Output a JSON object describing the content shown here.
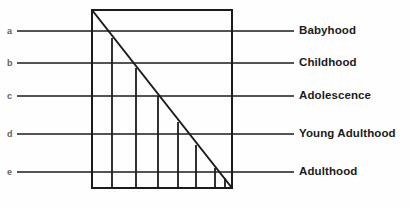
{
  "figure": {
    "background_color": "#fefefe",
    "ink_color": "#1b1b1b",
    "faint_ink_color": "#40403f",
    "width": 409,
    "height": 208
  },
  "rows": [
    {
      "key": "a",
      "label": "Babyhood",
      "leader_y": 31,
      "leader_x_start": 17,
      "leader_x_end": 294,
      "letter_x": 7,
      "label_x": 299
    },
    {
      "key": "b",
      "label": "Childhood",
      "leader_y": 63,
      "leader_x_start": 17,
      "leader_x_end": 294,
      "letter_x": 7,
      "label_x": 299
    },
    {
      "key": "c",
      "label": "Adolescence",
      "leader_y": 96,
      "leader_x_start": 17,
      "leader_x_end": 294,
      "letter_x": 7,
      "label_x": 299
    },
    {
      "key": "d",
      "label": "Young Adulthood",
      "leader_y": 134,
      "leader_x_start": 17,
      "leader_x_end": 294,
      "letter_x": 7,
      "label_x": 299
    },
    {
      "key": "e",
      "label": "Adulthood",
      "leader_y": 172,
      "leader_x_start": 17,
      "leader_x_end": 294,
      "letter_x": 7,
      "label_x": 299
    }
  ],
  "chart_data": {
    "type": "bar",
    "xlabel": "",
    "ylabel": "",
    "grid": false,
    "legend_position": "right",
    "categories": [
      "a",
      "b",
      "c",
      "d",
      "e"
    ],
    "series": [
      {
        "name": "Life stage",
        "labels": [
          "Babyhood",
          "Childhood",
          "Adolescence",
          "Young Adulthood",
          "Adulthood"
        ],
        "values": [
          1,
          2,
          3,
          4,
          5
        ]
      }
    ],
    "annotations": [
      "Diagonal declines from top-left corner to bottom-right corner of the frame",
      "Seven internal vertical tick lines rise from the baseline to meet the diagonal"
    ]
  },
  "frame": {
    "left": 92,
    "right": 232,
    "top": 10,
    "bottom": 188,
    "stroke_width": 2
  },
  "diagonal": {
    "x1": 92,
    "y1": 10,
    "x2": 232,
    "y2": 188,
    "stroke_width": 2
  },
  "verticals": [
    {
      "x": 112,
      "y_top": 38,
      "y_bottom": 188
    },
    {
      "x": 136,
      "y_top": 68,
      "y_bottom": 188
    },
    {
      "x": 158,
      "y_top": 96,
      "y_bottom": 188
    },
    {
      "x": 178,
      "y_top": 122,
      "y_bottom": 188
    },
    {
      "x": 196,
      "y_top": 145,
      "y_bottom": 188
    },
    {
      "x": 215,
      "y_top": 168,
      "y_bottom": 188
    },
    {
      "x": 225,
      "y_top": 178,
      "y_bottom": 188
    }
  ]
}
